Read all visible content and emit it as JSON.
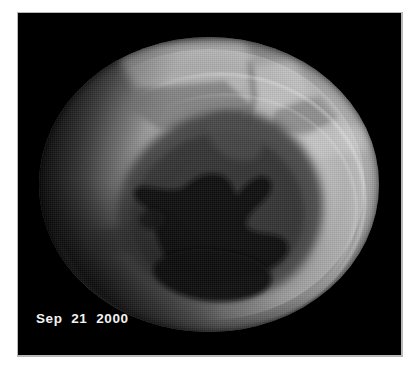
{
  "figure": {
    "kind": "satellite-ozone-image",
    "caption_date": "Sep  21  2000",
    "background_color": "#000000",
    "page_color": "#ffffff",
    "caption_color": "#f2f2f2",
    "panel": {
      "x": 18,
      "y": 13,
      "width": 383,
      "height": 342
    },
    "disk": {
      "label": "planetary-disk",
      "center_x": 191,
      "center_y": 171,
      "radius_x": 170,
      "radius_y": 147,
      "bright_limb_color": "#c8c8c8",
      "mid_tone_color": "#9a9a9a",
      "dark_limb_color": "#2a2a2a"
    },
    "features": [
      {
        "name": "ozone-hole",
        "tone": "very-dark",
        "color": "#0e0e0e",
        "position": "lower-center"
      },
      {
        "name": "ozone-hole-halo",
        "tone": "dark-gray",
        "color": "#4a4a4a",
        "position": "center"
      },
      {
        "name": "bright-limb-arc",
        "tone": "bright",
        "color": "#e6e6e6",
        "position": "right-and-lower-right"
      },
      {
        "name": "orbit-swath-patch-upper-left",
        "tone": "mid-gray",
        "color": "#8a8a8a",
        "position": "upper-center"
      },
      {
        "name": "orbit-swath-patch-upper-right",
        "tone": "mid-gray",
        "color": "#8f8f8f",
        "position": "upper-right"
      },
      {
        "name": "orbit-swath-seam",
        "tone": "edge",
        "color": "#777777",
        "position": "upper-center-vertical"
      }
    ]
  }
}
